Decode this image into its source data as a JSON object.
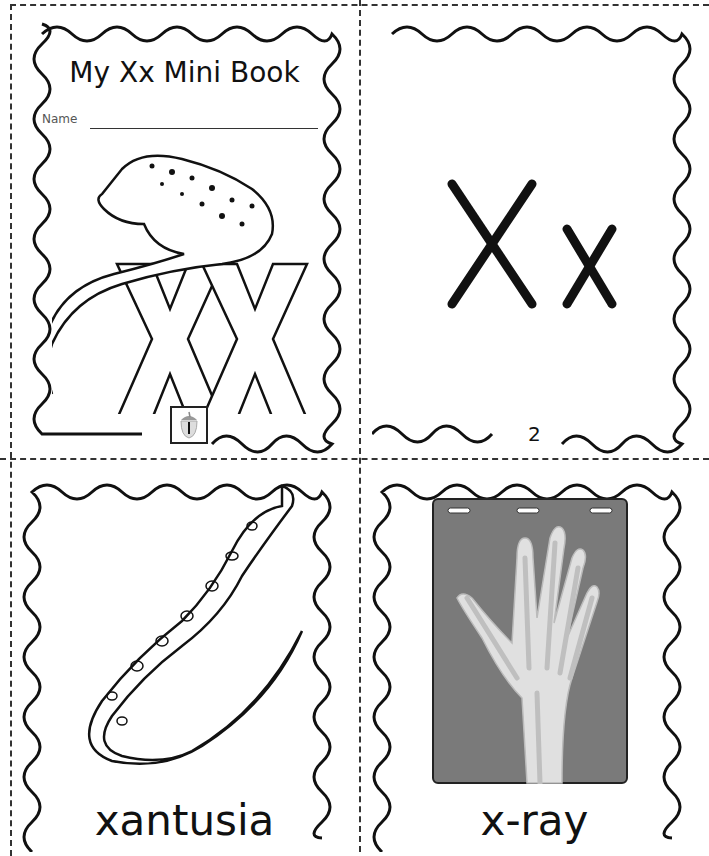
{
  "cover": {
    "title": "My Xx Mini Book",
    "name_label": "Name",
    "illustration": "lizard-on-letters-icon",
    "badge_icon": "acorn-icon"
  },
  "page2": {
    "letters": "Xx",
    "page_number": "2"
  },
  "page3": {
    "illustration": "xantusia-lizard-icon",
    "word": "xantusia"
  },
  "page4": {
    "illustration": "x-ray-hand-icon",
    "word": "x-ray"
  },
  "colors": {
    "ink": "#111111",
    "xray_bg": "#7a7a7a",
    "bone": "#d8d8d8"
  }
}
